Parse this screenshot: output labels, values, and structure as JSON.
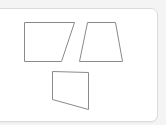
{
  "card": {
    "background": "#ffffff",
    "border_color": "#dcdcdc"
  },
  "shapes": [
    {
      "name": "quadrilateral-a",
      "type": "right-trapezoid",
      "points": "24.5,22.5 74.5,22.5 61.5,61.5 24.5,61.5"
    },
    {
      "name": "quadrilateral-b",
      "type": "trapezoid",
      "points": "87.5,22.5 115.5,22.5 122.5,61.5 79.5,61.5"
    },
    {
      "name": "quadrilateral-c",
      "type": "quadrilateral",
      "points": "52.5,71.5 88.5,72.5 88.5,109.5 52.5,99.5"
    }
  ],
  "stroke_color": "#8a8a8a"
}
